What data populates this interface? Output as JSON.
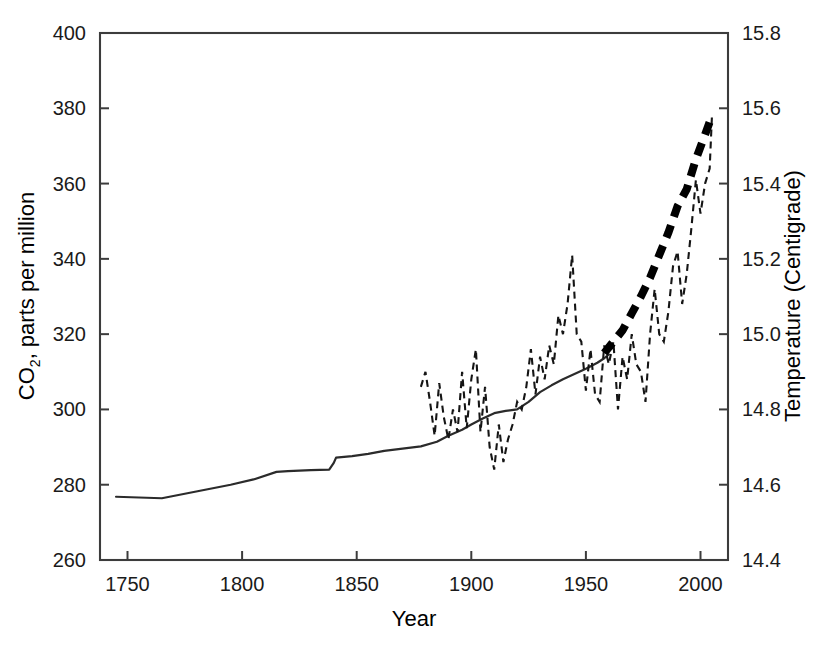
{
  "chart_data": {
    "type": "line",
    "title": "",
    "xlabel": "Year",
    "ylabel": "CO2, parts per million",
    "ylabel_text": "CO",
    "ylabel_sub": "2",
    "ylabel_rest": ", parts per million",
    "y2label": "Temperature (Centigrade)",
    "xlim": [
      1738,
      2012
    ],
    "ylim": [
      260,
      400
    ],
    "y2lim": [
      14.4,
      15.8
    ],
    "grid": false,
    "legend": "none",
    "xticks": [
      1750,
      1800,
      1850,
      1900,
      1950,
      2000
    ],
    "xtick_labels": [
      "1750",
      "1800",
      "1850",
      "1900",
      "1950",
      "2000"
    ],
    "yticks": [
      260,
      280,
      300,
      320,
      340,
      360,
      380,
      400
    ],
    "ytick_labels": [
      "260",
      "280",
      "300",
      "320",
      "340",
      "360",
      "380",
      "400"
    ],
    "y2ticks": [
      14.4,
      14.6,
      14.8,
      15.0,
      15.2,
      15.4,
      15.6,
      15.8
    ],
    "y2tick_labels": [
      "14.4",
      "14.6",
      "14.8",
      "15.0",
      "15.2",
      "15.4",
      "15.6",
      "15.8"
    ],
    "series": [
      {
        "name": "CO2 concentration",
        "style": "solid-thin",
        "axis": "left",
        "units": "ppm",
        "x": [
          1745,
          1755,
          1765,
          1775,
          1785,
          1795,
          1805,
          1815,
          1820,
          1830,
          1838,
          1840,
          1841,
          1848,
          1855,
          1862,
          1870,
          1878,
          1885,
          1890,
          1896,
          1900,
          1905,
          1910,
          1915,
          1920,
          1925,
          1930,
          1935,
          1940,
          1945,
          1950,
          1955,
          1958,
          1960
        ],
        "y": [
          276.8,
          276.6,
          276.4,
          277.6,
          278.8,
          280.0,
          281.4,
          283.4,
          283.6,
          283.9,
          284.0,
          285.8,
          287.2,
          287.6,
          288.2,
          289.0,
          289.6,
          290.2,
          291.4,
          293.0,
          294.6,
          296.0,
          297.6,
          299.0,
          299.6,
          300.0,
          302.0,
          304.6,
          306.4,
          308.0,
          309.4,
          310.8,
          312.4,
          313.6,
          314.6
        ]
      },
      {
        "name": "CO2 concentration (recent, bold dashed)",
        "style": "dashed-heavy",
        "axis": "left",
        "units": "ppm",
        "x": [
          1958,
          1962,
          1966,
          1970,
          1974,
          1978,
          1982,
          1986,
          1990,
          1994,
          1998,
          2002,
          2005
        ],
        "y": [
          315.0,
          318.0,
          321.0,
          325.5,
          330.0,
          335.0,
          341.0,
          347.0,
          354.0,
          358.5,
          366.5,
          373.0,
          378.0
        ]
      },
      {
        "name": "Global mean temperature",
        "style": "dashed-thin",
        "axis": "right",
        "units": "degrees Centigrade",
        "x": [
          1878,
          1880,
          1882,
          1884,
          1886,
          1888,
          1890,
          1892,
          1894,
          1896,
          1898,
          1900,
          1902,
          1904,
          1906,
          1908,
          1910,
          1912,
          1914,
          1916,
          1918,
          1920,
          1922,
          1924,
          1926,
          1928,
          1930,
          1932,
          1934,
          1936,
          1938,
          1940,
          1942,
          1944,
          1946,
          1948,
          1950,
          1952,
          1954,
          1956,
          1958,
          1960,
          1962,
          1964,
          1966,
          1968,
          1970,
          1972,
          1974,
          1976,
          1978,
          1980,
          1982,
          1984,
          1986,
          1988,
          1990,
          1992,
          1994,
          1996,
          1998,
          2000,
          2002,
          2004,
          2005
        ],
        "y": [
          14.86,
          14.9,
          14.82,
          14.73,
          14.87,
          14.78,
          14.72,
          14.8,
          14.74,
          14.9,
          14.75,
          14.88,
          14.96,
          14.74,
          14.86,
          14.7,
          14.64,
          14.76,
          14.66,
          14.72,
          14.76,
          14.82,
          14.8,
          14.86,
          14.96,
          14.84,
          14.94,
          14.88,
          14.97,
          14.92,
          15.05,
          15.0,
          15.08,
          15.21,
          15.0,
          14.98,
          14.85,
          14.96,
          14.84,
          14.82,
          14.97,
          14.92,
          14.98,
          14.8,
          14.94,
          14.88,
          15.0,
          14.92,
          14.9,
          14.82,
          15.0,
          15.12,
          15.0,
          14.98,
          15.06,
          15.18,
          15.22,
          15.08,
          15.16,
          15.28,
          15.41,
          15.32,
          15.4,
          15.44,
          15.58
        ]
      }
    ]
  }
}
